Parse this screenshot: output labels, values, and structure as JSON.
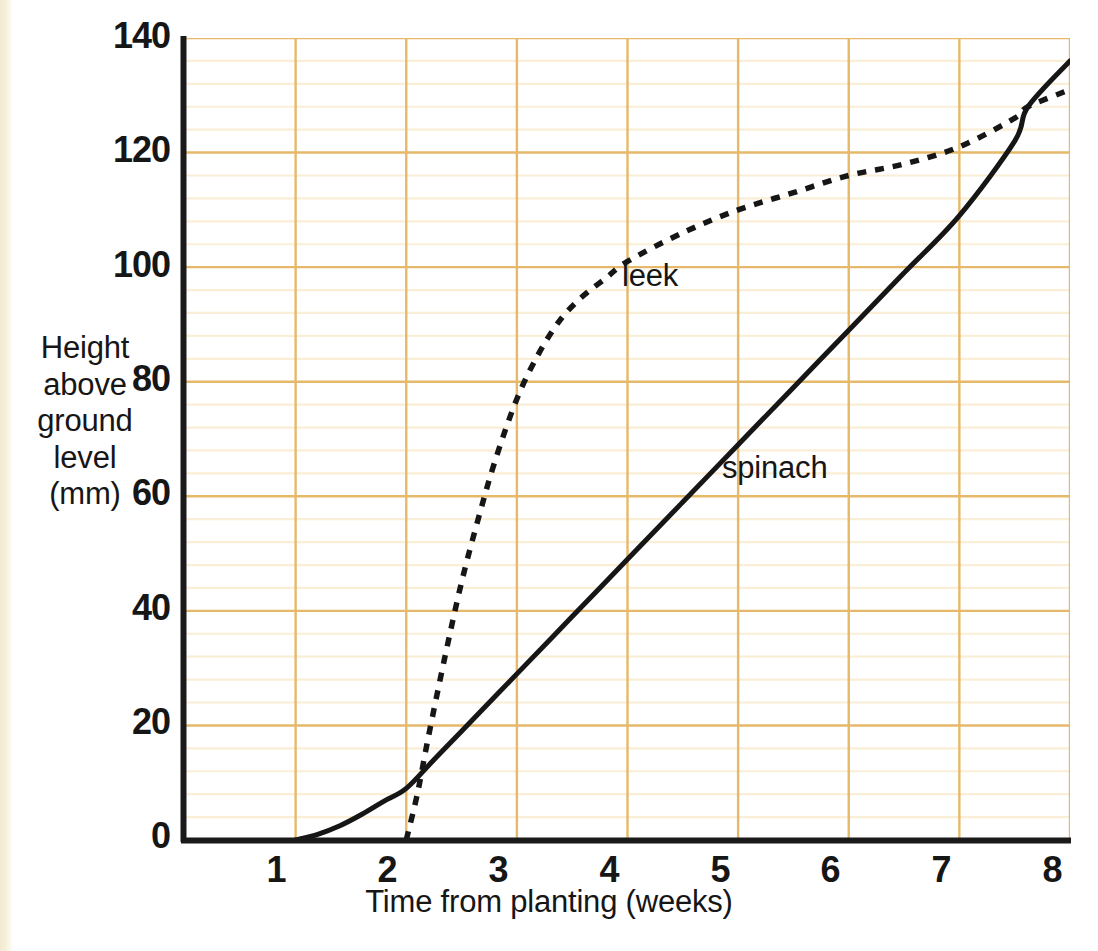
{
  "figure": {
    "background_color": "#ffffff",
    "edge_strip_color": "#f2ead0"
  },
  "axes": {
    "y_title_lines": [
      "Height",
      "above",
      "ground",
      "level",
      "(mm)"
    ],
    "x_title": "Time from planting (weeks)",
    "y_ticks": [
      "0",
      "20",
      "40",
      "60",
      "80",
      "100",
      "120",
      "140"
    ],
    "x_ticks": [
      "0",
      "1",
      "2",
      "3",
      "4",
      "5",
      "6",
      "7",
      "8"
    ],
    "axis_color": "#1a1a1a",
    "major_grid_color": "#e6b96a",
    "minor_grid_color": "#faeed6"
  },
  "annotations": {
    "leek_label": "leek",
    "spinach_label": "spinach"
  },
  "chart_data": {
    "type": "line",
    "title": "",
    "xlabel": "Time from planting (weeks)",
    "ylabel": "Height above ground level (mm)",
    "xlim": [
      0,
      8
    ],
    "ylim": [
      0,
      140
    ],
    "x_major_step": 1,
    "y_major_step": 20,
    "y_minor_step": 4,
    "grid": true,
    "legend": "inline-annotations",
    "series": [
      {
        "name": "spinach",
        "style": "solid",
        "color": "#161616",
        "points": [
          [
            1.0,
            0
          ],
          [
            1.2,
            1
          ],
          [
            1.4,
            2.5
          ],
          [
            1.6,
            4.5
          ],
          [
            1.8,
            6.8
          ],
          [
            2.0,
            9
          ],
          [
            2.25,
            14
          ],
          [
            2.5,
            19
          ],
          [
            3.0,
            29
          ],
          [
            3.5,
            39
          ],
          [
            4.0,
            49
          ],
          [
            4.5,
            59
          ],
          [
            5.0,
            69
          ],
          [
            5.5,
            79
          ],
          [
            6.0,
            89
          ],
          [
            6.5,
            99
          ],
          [
            7.0,
            109
          ],
          [
            7.5,
            122
          ],
          [
            7.62,
            128
          ],
          [
            8.0,
            136
          ]
        ]
      },
      {
        "name": "leek",
        "style": "dashed",
        "color": "#161616",
        "points": [
          [
            2.0,
            0
          ],
          [
            2.1,
            8
          ],
          [
            2.2,
            18
          ],
          [
            2.35,
            32
          ],
          [
            2.5,
            45
          ],
          [
            2.65,
            56
          ],
          [
            2.8,
            66
          ],
          [
            3.0,
            77
          ],
          [
            3.2,
            85
          ],
          [
            3.4,
            91
          ],
          [
            3.6,
            95
          ],
          [
            3.8,
            98
          ],
          [
            4.0,
            101
          ],
          [
            4.5,
            106
          ],
          [
            5.0,
            110
          ],
          [
            5.5,
            113
          ],
          [
            6.0,
            116
          ],
          [
            6.5,
            118
          ],
          [
            7.0,
            121
          ],
          [
            7.5,
            126
          ],
          [
            7.62,
            128
          ],
          [
            8.0,
            131
          ]
        ]
      }
    ],
    "notes": {
      "spinach_emerges_week": 1,
      "leek_emerges_week": 2,
      "crossover_week": 7.6,
      "crossover_height": 128
    }
  }
}
